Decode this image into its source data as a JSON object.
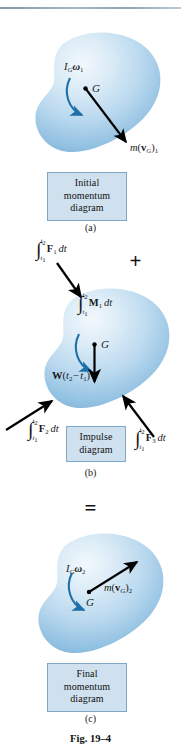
{
  "figure": {
    "number": "Fig. 19–4",
    "rule_color": "#8aa2b5",
    "body_fill_light": "#eaf3fa",
    "body_fill_mid": "#b4d4ea",
    "body_fill_dark": "#7fb4da",
    "arrow_color": "#000000",
    "curved_arrow_color": "#1f6fa8",
    "caption_box_fill": "#cfe0ee",
    "caption_box_border": "#7fa6c4"
  },
  "panels": [
    {
      "id": "a",
      "sublabel": "(a)",
      "caption_lines": [
        "Initial",
        "momentum",
        "diagram"
      ],
      "labels": {
        "angular_momentum": "I_G ω_1",
        "linear_momentum": "m(v_G)_1",
        "center_of_mass": "G"
      }
    },
    {
      "id": "b",
      "sublabel": "(b)",
      "caption_lines": [
        "Impulse",
        "diagram"
      ],
      "labels": {
        "force_impulse_1": "∫_{t1}^{t2} F_1 dt",
        "moment_impulse": "∫_{t1}^{t2} M_1 dt",
        "weight_impulse": "W(t_2 − t_1)",
        "force_impulse_2": "∫_{t1}^{t2} F_2 dt",
        "force_impulse_3": "∫_{t1}^{t2} F_3 dt",
        "center_of_mass": "G"
      }
    },
    {
      "id": "c",
      "sublabel": "(c)",
      "caption_lines": [
        "Final",
        "momentum",
        "diagram"
      ],
      "labels": {
        "angular_momentum": "I_G ω_2",
        "linear_momentum": "m(v_G)_2",
        "center_of_mass": "G"
      }
    }
  ],
  "operators": {
    "plus": "+",
    "equals": "="
  },
  "text": {
    "panel_a": {
      "sublabel": "(a)",
      "cap1": "Initial",
      "cap2": "momentum",
      "cap3": "diagram",
      "G": "G",
      "I": "I",
      "Gsub": "G",
      "omega": "ω",
      "one": "1",
      "m": "m",
      "paren_open": "(",
      "vbold": "v",
      "vsub": "G",
      "paren_close": ")",
      "vnum": "1"
    },
    "panel_b": {
      "sublabel": "(b)",
      "cap1": "Impulse",
      "cap2": "diagram",
      "G": "G",
      "F1": "F",
      "F1n": "1",
      "dt": "dt",
      "t_up": "t",
      "t_up_n": "2",
      "t_lo": "t",
      "t_lo_n": "1",
      "M1": "M",
      "M1n": "1",
      "W": "W",
      "wparen_open": "(",
      "wt2": "t",
      "wt2n": "2",
      "minus": "−",
      "wt1": "t",
      "wt1n": "1",
      "wparen_close": ")",
      "F2": "F",
      "F2n": "2",
      "F3": "F",
      "F3n": "3"
    },
    "panel_c": {
      "sublabel": "(c)",
      "cap1": "Final",
      "cap2": "momentum",
      "cap3": "diagram",
      "G": "G",
      "I": "I",
      "Gsub": "G",
      "omega": "ω",
      "two": "2",
      "m": "m",
      "paren_open": "(",
      "vbold": "v",
      "vsub": "G",
      "paren_close": ")",
      "vnum": "2"
    },
    "plus": "+",
    "equals": "=",
    "figno": "Fig. 19–4"
  }
}
